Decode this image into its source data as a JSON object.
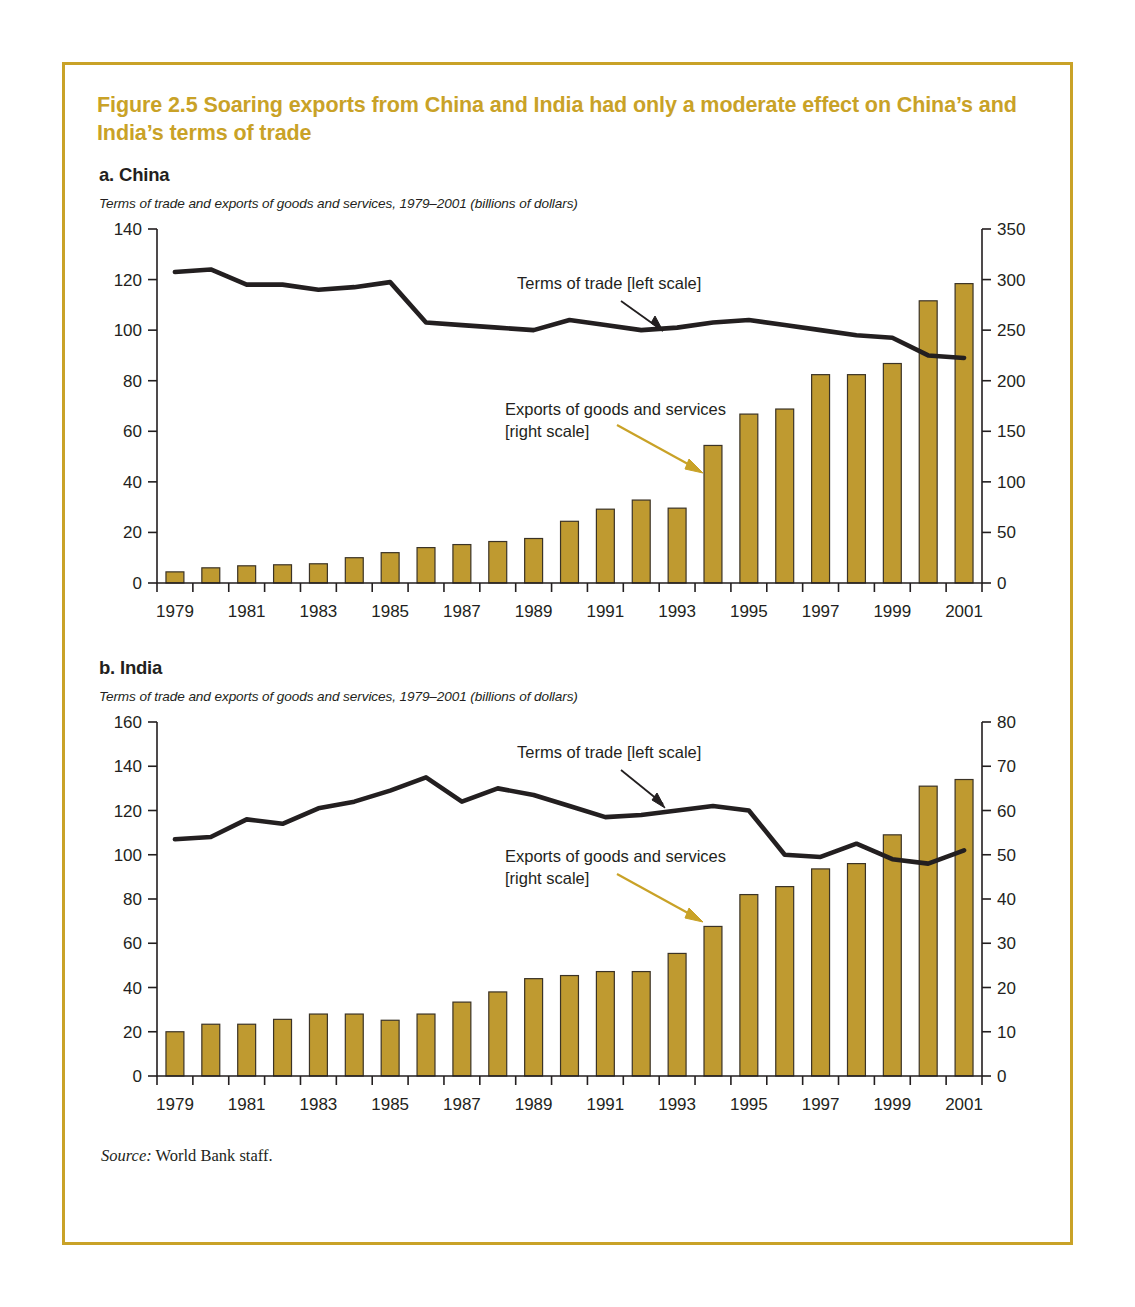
{
  "figure": {
    "title": "Figure 2.5  Soaring exports from China and India had only a moderate effect on China’s and India’s terms of trade",
    "source_lead": "Source:",
    "source_text": " World Bank staff.",
    "frame_color": "#C9A227",
    "bar_color": "#BF9A30",
    "bar_border_color": "#3b3326",
    "line_color": "#231f20"
  },
  "panel_a": {
    "label": "a. China",
    "subtitle": "Terms of trade and exports of goods and services, 1979–2001 (billions of dollars)",
    "annotation_line": "Terms of trade [left scale]",
    "annotation_bars_line1": "Exports of goods and services",
    "annotation_bars_line2": "[right scale]"
  },
  "panel_b": {
    "label": "b. India",
    "subtitle": "Terms of trade and exports of goods and services, 1979–2001 (billions of dollars)",
    "annotation_line": "Terms of trade [left scale]",
    "annotation_bars_line1": "Exports of goods and services",
    "annotation_bars_line2": "[right scale]"
  },
  "chart_data": [
    {
      "id": "china",
      "type": "bar",
      "title": "a. China",
      "subtitle": "Terms of trade and exports of goods and services, 1979–2001 (billions of dollars)",
      "xlabel": "",
      "ylabel": "",
      "grid": false,
      "legend_position": "inline-annotations",
      "x": [
        1979,
        1980,
        1981,
        1982,
        1983,
        1984,
        1985,
        1986,
        1987,
        1988,
        1989,
        1990,
        1991,
        1992,
        1993,
        1994,
        1995,
        1996,
        1997,
        1998,
        1999,
        2000,
        2001
      ],
      "xtick_labels": [
        "1979",
        "",
        "1981",
        "",
        "1983",
        "",
        "1985",
        "",
        "1987",
        "",
        "1989",
        "",
        "1991",
        "",
        "1993",
        "",
        "1995",
        "",
        "1997",
        "",
        "1999",
        "",
        "2001"
      ],
      "left_axis": {
        "name": "Terms of trade [left scale]",
        "ylim": [
          0,
          140
        ],
        "ticks": [
          0,
          20,
          40,
          60,
          80,
          100,
          120,
          140
        ],
        "tick_labels": [
          "0",
          "20",
          "40",
          "60",
          "80",
          "100",
          "120",
          "140"
        ]
      },
      "right_axis": {
        "name": "Exports of goods and services [right scale]",
        "ylim": [
          0,
          350
        ],
        "ticks": [
          0,
          50,
          100,
          150,
          200,
          250,
          300,
          350
        ],
        "tick_labels": [
          "0",
          "50",
          "100",
          "150",
          "200",
          "250",
          "300",
          "350"
        ]
      },
      "series": [
        {
          "name": "Exports of goods and services [right scale]",
          "type": "bar",
          "axis": "right",
          "color": "#BF9A30",
          "values": [
            11,
            15,
            17,
            18,
            19,
            25,
            30,
            35,
            38,
            41,
            44,
            61,
            73,
            82,
            74,
            136,
            167,
            172,
            206,
            206,
            217,
            279,
            296
          ]
        },
        {
          "name": "Terms of trade [left scale]",
          "type": "line",
          "axis": "left",
          "color": "#231f20",
          "values": [
            123,
            124,
            118,
            118,
            116,
            117,
            119,
            103,
            102,
            101,
            100,
            104,
            102,
            100,
            101,
            103,
            104,
            102,
            100,
            98,
            97,
            90,
            89
          ]
        }
      ]
    },
    {
      "id": "india",
      "type": "bar",
      "title": "b. India",
      "subtitle": "Terms of trade and exports of goods and services, 1979–2001 (billions of dollars)",
      "xlabel": "",
      "ylabel": "",
      "grid": false,
      "legend_position": "inline-annotations",
      "x": [
        1979,
        1980,
        1981,
        1982,
        1983,
        1984,
        1985,
        1986,
        1987,
        1988,
        1989,
        1990,
        1991,
        1992,
        1993,
        1994,
        1995,
        1996,
        1997,
        1998,
        1999,
        2000,
        2001
      ],
      "xtick_labels": [
        "1979",
        "",
        "1981",
        "",
        "1983",
        "",
        "1985",
        "",
        "1987",
        "",
        "1989",
        "",
        "1991",
        "",
        "1993",
        "",
        "1995",
        "",
        "1997",
        "",
        "1999",
        "",
        "2001"
      ],
      "left_axis": {
        "name": "Terms of trade [left scale]",
        "ylim": [
          0,
          160
        ],
        "ticks": [
          0,
          20,
          40,
          60,
          80,
          100,
          120,
          140,
          160
        ],
        "tick_labels": [
          "0",
          "20",
          "40",
          "60",
          "80",
          "100",
          "120",
          "140",
          "160"
        ]
      },
      "right_axis": {
        "name": "Exports of goods and services [right scale]",
        "ylim": [
          0,
          80
        ],
        "ticks": [
          0,
          10,
          20,
          30,
          40,
          50,
          60,
          70,
          80
        ],
        "tick_labels": [
          "0",
          "10",
          "20",
          "30",
          "40",
          "50",
          "60",
          "70",
          "80"
        ]
      },
      "series": [
        {
          "name": "Exports of goods and services [right scale]",
          "type": "bar",
          "axis": "right",
          "color": "#BF9A30",
          "values": [
            10,
            11.7,
            11.7,
            12.8,
            14,
            14,
            12.6,
            14,
            16.7,
            19,
            22,
            22.7,
            23.6,
            23.6,
            27.7,
            33.8,
            41,
            42.8,
            46.8,
            48,
            54.5,
            65.5,
            67
          ]
        },
        {
          "name": "Terms of trade [left scale]",
          "type": "line",
          "axis": "left",
          "color": "#231f20",
          "values": [
            107,
            108,
            116,
            114,
            121,
            124,
            129,
            135,
            124,
            130,
            127,
            122,
            117,
            118,
            120,
            122,
            120,
            100,
            99,
            105,
            98,
            96,
            102
          ]
        }
      ]
    }
  ]
}
